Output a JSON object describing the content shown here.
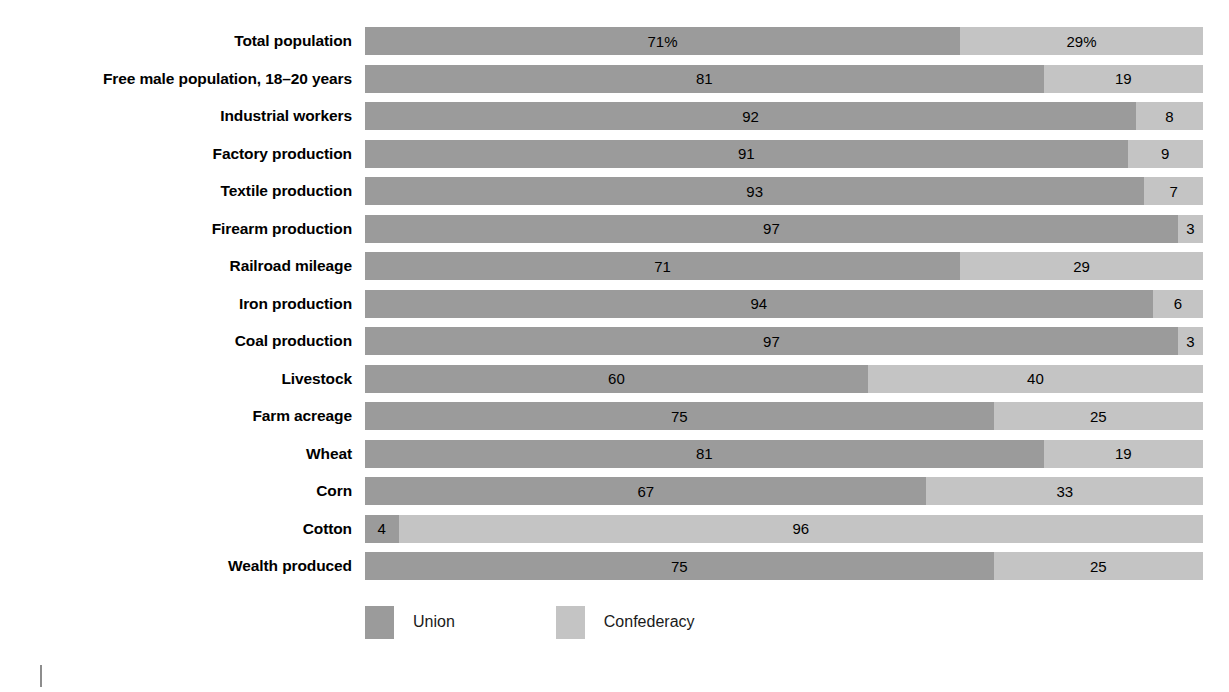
{
  "chart_data": {
    "type": "bar",
    "subtype": "stacked-horizontal-100-percent",
    "title": "",
    "subtitle": "",
    "xlabel": "",
    "ylabel": "",
    "xlim": [
      0,
      100
    ],
    "grid": false,
    "legend_position": "bottom-left",
    "categories": [
      "Total population",
      "Free male population, 18–20 years",
      "Industrial workers",
      "Factory production",
      "Textile production",
      "Firearm production",
      "Railroad mileage",
      "Iron production",
      "Coal production",
      "Livestock",
      "Farm acreage",
      "Wheat",
      "Corn",
      "Cotton",
      "Wealth produced"
    ],
    "series": [
      {
        "name": "Union",
        "color": "#9b9b9b",
        "values": [
          71,
          81,
          92,
          91,
          93,
          97,
          71,
          94,
          97,
          60,
          75,
          81,
          67,
          4,
          75
        ],
        "labels": [
          "71%",
          "81",
          "92",
          "91",
          "93",
          "97",
          "71",
          "94",
          "97",
          "60",
          "75",
          "81",
          "67",
          "4",
          "75"
        ]
      },
      {
        "name": "Confederacy",
        "color": "#c4c4c4",
        "values": [
          29,
          19,
          8,
          9,
          7,
          3,
          29,
          6,
          3,
          40,
          25,
          19,
          33,
          96,
          25
        ],
        "labels": [
          "29%",
          "19",
          "8",
          "9",
          "7",
          "3",
          "29",
          "6",
          "3",
          "40",
          "25",
          "19",
          "33",
          "96",
          "25"
        ]
      }
    ]
  },
  "legend": {
    "items": [
      {
        "label": "Union",
        "color": "#9b9b9b",
        "swatch": "legend-swatch-union"
      },
      {
        "label": "Confederacy",
        "color": "#c4c4c4",
        "swatch": "legend-swatch-confederacy"
      }
    ]
  },
  "colors": {
    "union": "#9b9b9b",
    "confederacy": "#c4c4c4",
    "background": "#ffffff",
    "text": "#000000",
    "tick": "#8d8d8d"
  }
}
